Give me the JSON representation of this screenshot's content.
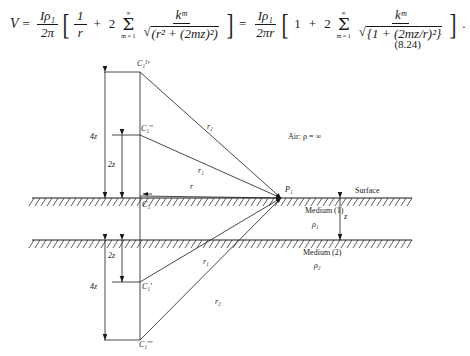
{
  "equation": {
    "lhs_var": "V",
    "equals": "=",
    "coef1_num": "Iρ₁",
    "coef1_den": "2π",
    "bracket_open": "[",
    "bracket_close": "]",
    "term1_num": "1",
    "term1_den": "r",
    "plus": "+",
    "two": "2",
    "sum_upper": "∞",
    "sum_symbol": "Σ",
    "sum_lower": "m = 1",
    "frac2_num": "kᵐ",
    "frac2_den_radical": "√",
    "frac2_den_body": "(r² + (2mz)²)",
    "equals2": "=",
    "coef2_num": "Iρ₁",
    "coef2_den": "2πr",
    "term2_one": "1",
    "frac3_num": "kᵐ",
    "frac3_den_body": "{1 + (2mz/r)²}",
    "period": ".",
    "number": "(8.24)"
  },
  "figure": {
    "points": {
      "c1_iv": "C₁ᴵᵛ",
      "c1_dprime": "C₁′′",
      "c1_source": "C₁",
      "c1_prime": "C₁′",
      "c1_tprime": "C₁′′′",
      "p1": "P₁"
    },
    "rays": {
      "r_top2": "r₂",
      "r_top1": "r₁",
      "r_direct": "r",
      "r_bot1": "r₁",
      "r_bot2": "r₂"
    },
    "dimensions": {
      "four_z_top": "4z",
      "two_z_top": "2z",
      "two_z_bottom": "2z",
      "four_z_bottom": "4z",
      "thickness_z": "z"
    },
    "regions": {
      "air": "Air:  ρ = ∞",
      "surface": "Surface",
      "medium1": "Medium (1)",
      "rho1": "ρ₁",
      "medium2": "Medium (2)",
      "rho2": "ρ₂"
    },
    "colors": {
      "line": "#1a1a1a",
      "background": "#ffffff"
    }
  }
}
